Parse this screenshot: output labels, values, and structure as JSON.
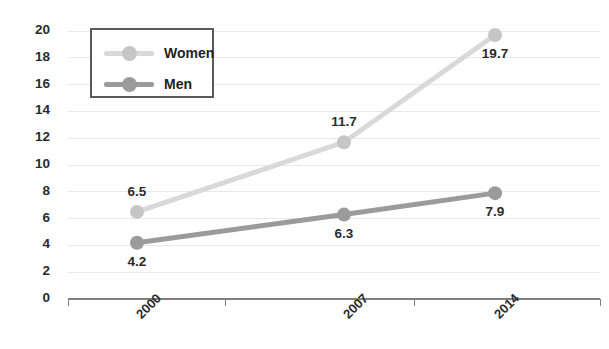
{
  "chart_data": {
    "type": "line",
    "title": "",
    "subtitle": "",
    "xlabel": "",
    "ylabel": "",
    "categories": [
      "2000",
      "2007",
      "2014"
    ],
    "series": [
      {
        "name": "Women",
        "values": [
          6.5,
          11.7,
          19.7
        ],
        "labels": [
          "6.5",
          "11.7",
          "19.7"
        ],
        "color": "#d9d9d9",
        "marker_color": "#c6c6c6",
        "label_positions": [
          "above",
          "above",
          "below"
        ]
      },
      {
        "name": "Men",
        "values": [
          4.2,
          6.3,
          7.9
        ],
        "labels": [
          "4.2",
          "6.3",
          "7.9"
        ],
        "color": "#9b9b9b",
        "marker_color": "#9b9b9b",
        "label_positions": [
          "below",
          "below",
          "below"
        ]
      }
    ],
    "ylim": [
      0,
      20
    ],
    "ytick_step": 2,
    "ytick_labels": [
      "20",
      "18",
      "16",
      "14",
      "12",
      "10",
      "8",
      "6",
      "4",
      "2",
      "0"
    ],
    "grid": true,
    "grid_color": "#e8e8e8",
    "axis_color": "#808080",
    "legend_position": "top-left",
    "background": "#ffffff",
    "xtick_rotation": -45
  },
  "legend": {
    "items": [
      {
        "label": "Women"
      },
      {
        "label": "Men"
      }
    ]
  }
}
